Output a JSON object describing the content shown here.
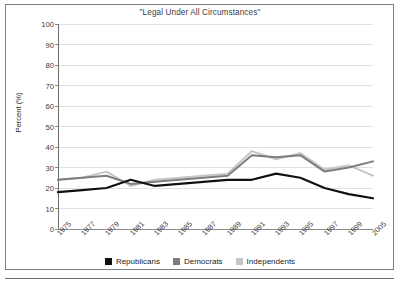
{
  "chart_data": {
    "type": "line",
    "title": "\"Legal Under All Circumstances\"",
    "xlabel": "",
    "ylabel": "Percent (%)",
    "ylim": [
      0,
      100
    ],
    "ytick_step": 10,
    "yticks": [
      "0",
      "10",
      "20",
      "30",
      "40",
      "50",
      "60",
      "70",
      "80",
      "90",
      "100"
    ],
    "grid": true,
    "legend_position": "bottom",
    "categories": [
      "1975",
      "1977",
      "1979",
      "1981",
      "1983",
      "1985",
      "1987",
      "1989",
      "1991",
      "1993",
      "1995",
      "1997",
      "1999",
      "2005"
    ],
    "series": [
      {
        "name": "Republicans",
        "color": "#111111",
        "values": [
          18,
          19,
          20,
          24,
          21,
          22,
          23,
          24,
          24,
          27,
          25,
          20,
          17,
          15
        ]
      },
      {
        "name": "Democrats",
        "color": "#7d7d7d",
        "values": [
          24,
          25,
          26,
          22,
          23,
          24,
          25,
          26,
          36,
          35,
          36,
          28,
          30,
          33
        ]
      },
      {
        "name": "Independents",
        "color": "#c6c6c6",
        "values": [
          24,
          25,
          28,
          21,
          24,
          25,
          26,
          27,
          38,
          34,
          37,
          29,
          31,
          26
        ]
      }
    ]
  },
  "legend": {
    "items": [
      {
        "label": "Republicans",
        "color": "#111111"
      },
      {
        "label": "Democrats",
        "color": "#7d7d7d"
      },
      {
        "label": "Independents",
        "color": "#c6c6c6"
      }
    ]
  }
}
